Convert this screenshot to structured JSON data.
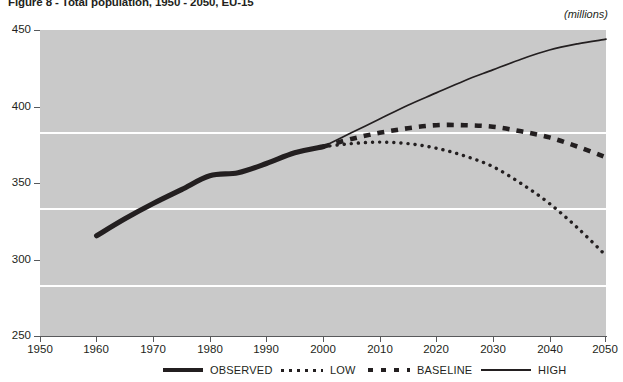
{
  "figure": {
    "title": "Figure 8 - Total population, 1950 - 2050, EU-15",
    "units": "(millions)"
  },
  "legend": {
    "items": [
      {
        "label": "OBSERVED",
        "style": "solid-thick"
      },
      {
        "label": "LOW",
        "style": "dotted"
      },
      {
        "label": "BASELINE",
        "style": "dashed-thick"
      },
      {
        "label": "HIGH",
        "style": "solid-thin"
      }
    ]
  },
  "chart_data": {
    "type": "line",
    "title": "Figure 8 - Total population, 1950 - 2050, EU-15",
    "xlabel": "",
    "ylabel": "(millions)",
    "xlim": [
      1950,
      2050
    ],
    "ylim": [
      250,
      450
    ],
    "xticks": [
      1950,
      1960,
      1970,
      1980,
      1990,
      2000,
      2010,
      2020,
      2030,
      2040,
      2050
    ],
    "yticks": [
      250,
      300,
      350,
      400,
      450
    ],
    "grid": "horizontal",
    "legend_position": "bottom",
    "series": [
      {
        "name": "OBSERVED",
        "style": "solid-thick",
        "color": "#231f20",
        "x": [
          1960,
          1965,
          1970,
          1975,
          1980,
          1985,
          1990,
          1995,
          2000
        ],
        "values": [
          316,
          327,
          337,
          346,
          355,
          357,
          363,
          370,
          374
        ]
      },
      {
        "name": "LOW",
        "style": "dotted",
        "color": "#231f20",
        "x": [
          2000,
          2005,
          2010,
          2015,
          2020,
          2025,
          2030,
          2035,
          2040,
          2045,
          2050
        ],
        "values": [
          374,
          376,
          377,
          376,
          373,
          368,
          361,
          350,
          337,
          321,
          303
        ]
      },
      {
        "name": "BASELINE",
        "style": "dashed-thick",
        "color": "#231f20",
        "x": [
          2000,
          2005,
          2010,
          2015,
          2020,
          2025,
          2030,
          2035,
          2040,
          2045,
          2050
        ],
        "values": [
          374,
          379,
          383,
          386,
          388,
          388,
          387,
          384,
          380,
          374,
          367
        ]
      },
      {
        "name": "HIGH",
        "style": "solid-thin",
        "color": "#231f20",
        "x": [
          2000,
          2005,
          2010,
          2015,
          2020,
          2025,
          2030,
          2035,
          2040,
          2045,
          2050
        ],
        "values": [
          374,
          383,
          392,
          401,
          409,
          417,
          424,
          431,
          437,
          441,
          444
        ]
      }
    ]
  }
}
